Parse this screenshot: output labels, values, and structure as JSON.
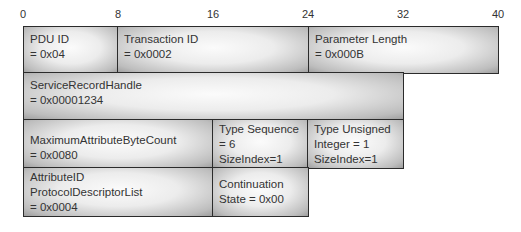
{
  "diagram": {
    "title": "",
    "bit_scale": {
      "ticks": [
        {
          "label": "0",
          "x": 23
        },
        {
          "label": "8",
          "x": 118
        },
        {
          "label": "16",
          "x": 213
        },
        {
          "label": "24",
          "x": 308
        },
        {
          "label": "32",
          "x": 403
        },
        {
          "label": "40",
          "x": 498
        }
      ]
    },
    "rows": [
      {
        "cells": [
          {
            "lines": [
              "PDU ID",
              "= 0x04"
            ]
          },
          {
            "lines": [
              "Transaction ID",
              "= 0x0002"
            ]
          },
          {
            "lines": [
              "Parameter Length",
              "= 0x000B"
            ]
          }
        ]
      },
      {
        "cells": [
          {
            "lines": [
              "ServiceRecordHandle",
              "= 0x00001234"
            ]
          }
        ]
      },
      {
        "cells": [
          {
            "lines": [
              "MaximumAttributeByteCount",
              "= 0x0080"
            ]
          },
          {
            "lines": [
              "Type Sequence",
              "= 6",
              "SizeIndex=1"
            ]
          },
          {
            "lines": [
              "Type Unsigned",
              "Integer = 1",
              "SizeIndex=1"
            ]
          }
        ]
      },
      {
        "cells": [
          {
            "lines": [
              "AttributeID",
              "ProtocolDescriptorList",
              "= 0x0004"
            ]
          },
          {
            "lines": [
              "Continuation",
              "State = 0x00"
            ]
          }
        ]
      }
    ]
  }
}
